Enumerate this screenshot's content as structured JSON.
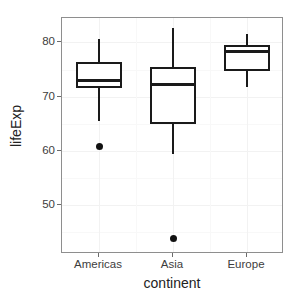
{
  "chart_data": {
    "type": "box",
    "title": "",
    "xlabel": "continent",
    "ylabel": "lifeExp",
    "categories": [
      "Americas",
      "Asia",
      "Europe"
    ],
    "ylim": [
      41.0,
      84.5
    ],
    "yticks": [
      50,
      60,
      70,
      80
    ],
    "ytick_labels": [
      "50",
      "60",
      "70",
      "80"
    ],
    "grid": true,
    "grid_color": "#f2f2f2",
    "legend": "none",
    "box_fill": "#ffffff",
    "box_line_color": "#1a1a1a",
    "panel_border_color": "#8e8e8e",
    "background": "#ffffff",
    "boxes": [
      {
        "category": "Americas",
        "whisker_low": 65.5,
        "q1": 71.6,
        "median": 72.9,
        "q3": 76.4,
        "whisker_high": 80.7,
        "outliers": [
          60.9
        ]
      },
      {
        "category": "Asia",
        "whisker_low": 59.4,
        "q1": 65.0,
        "median": 72.2,
        "q3": 75.4,
        "whisker_high": 82.6,
        "outliers": [
          43.8
        ]
      },
      {
        "category": "Europe",
        "whisker_low": 71.8,
        "q1": 74.8,
        "median": 78.4,
        "q3": 79.6,
        "whisker_high": 81.5,
        "outliers": []
      }
    ]
  },
  "axis": {
    "y_title": "lifeExp",
    "x_title": "continent"
  }
}
